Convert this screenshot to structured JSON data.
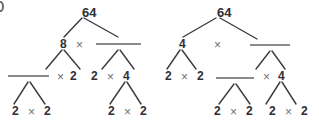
{
  "page": {
    "background_color": "#ffffff",
    "ink_color": "#2e2e33",
    "times_color": "#6e6e76",
    "blank_line_color": "#8a8a90",
    "branch_color": "#3a3a42",
    "corner_mark": ")"
  },
  "diagram": {
    "type": "factor-trees",
    "trees": [
      {
        "id": "factor-tree-left",
        "root": "64",
        "nodes": [
          {
            "id": "l-root",
            "label": "64",
            "x": 82,
            "y": 12,
            "kind": "number"
          },
          {
            "id": "l-a",
            "label": "8",
            "x": 60,
            "y": 44,
            "kind": "number"
          },
          {
            "id": "l-op1",
            "label": "×",
            "x": 76,
            "y": 45,
            "kind": "operator"
          },
          {
            "id": "l-b",
            "label": "",
            "x": 117,
            "y": 44,
            "kind": "blank"
          },
          {
            "id": "l-c",
            "label": "",
            "x": 28,
            "y": 76,
            "kind": "blank"
          },
          {
            "id": "l-op2",
            "label": "×",
            "x": 57,
            "y": 77,
            "kind": "operator"
          },
          {
            "id": "l-d",
            "label": "2",
            "x": 70,
            "y": 76,
            "kind": "number"
          },
          {
            "id": "l-e",
            "label": "2",
            "x": 91,
            "y": 76,
            "kind": "number"
          },
          {
            "id": "l-op3",
            "label": "×",
            "x": 107,
            "y": 77,
            "kind": "operator"
          },
          {
            "id": "l-f",
            "label": "4",
            "x": 123,
            "y": 76,
            "kind": "number"
          },
          {
            "id": "l-g",
            "label": "2",
            "x": 12,
            "y": 111,
            "kind": "number"
          },
          {
            "id": "l-op4",
            "label": "×",
            "x": 28,
            "y": 112,
            "kind": "operator"
          },
          {
            "id": "l-h",
            "label": "2",
            "x": 44,
            "y": 111,
            "kind": "number"
          },
          {
            "id": "l-i",
            "label": "2",
            "x": 108,
            "y": 111,
            "kind": "number"
          },
          {
            "id": "l-op5",
            "label": "×",
            "x": 124,
            "y": 112,
            "kind": "operator"
          },
          {
            "id": "l-j",
            "label": "2",
            "x": 140,
            "y": 111,
            "kind": "number"
          }
        ],
        "blanks": [
          {
            "id": "l-blank-1",
            "x1": 96,
            "x2": 141,
            "y": 44
          },
          {
            "id": "l-blank-2",
            "x1": 8,
            "x2": 49,
            "y": 76
          }
        ],
        "branches": [
          {
            "from": [
              82,
              18
            ],
            "to": [
              64,
              37
            ]
          },
          {
            "from": [
              84,
              18
            ],
            "to": [
              118,
              37
            ]
          },
          {
            "from": [
              62,
              50
            ],
            "to": [
              46,
              69
            ]
          },
          {
            "from": [
              64,
              50
            ],
            "to": [
              80,
              69
            ]
          },
          {
            "from": [
              118,
              50
            ],
            "to": [
              102,
              69
            ]
          },
          {
            "from": [
              120,
              50
            ],
            "to": [
              134,
              69
            ]
          },
          {
            "from": [
              28,
              82
            ],
            "to": [
              14,
              104
            ]
          },
          {
            "from": [
              30,
              82
            ],
            "to": [
              45,
              104
            ]
          },
          {
            "from": [
              125,
              82
            ],
            "to": [
              110,
              104
            ]
          },
          {
            "from": [
              127,
              82
            ],
            "to": [
              141,
              104
            ]
          }
        ]
      },
      {
        "id": "factor-tree-right",
        "root": "64",
        "nodes": [
          {
            "id": "r-root",
            "label": "64",
            "x": 217,
            "y": 12,
            "kind": "number"
          },
          {
            "id": "r-a",
            "label": "4",
            "x": 179,
            "y": 44,
            "kind": "number"
          },
          {
            "id": "r-op1",
            "label": "×",
            "x": 214,
            "y": 45,
            "kind": "operator"
          },
          {
            "id": "r-b",
            "label": "",
            "x": 269,
            "y": 44,
            "kind": "blank"
          },
          {
            "id": "r-c",
            "label": "2",
            "x": 165,
            "y": 76,
            "kind": "number"
          },
          {
            "id": "r-op2",
            "label": "×",
            "x": 181,
            "y": 77,
            "kind": "operator"
          },
          {
            "id": "r-d",
            "label": "2",
            "x": 197,
            "y": 76,
            "kind": "number"
          },
          {
            "id": "r-e",
            "label": "",
            "x": 235,
            "y": 78,
            "kind": "blank"
          },
          {
            "id": "r-op3",
            "label": "×",
            "x": 263,
            "y": 77,
            "kind": "operator"
          },
          {
            "id": "r-f",
            "label": "4",
            "x": 278,
            "y": 76,
            "kind": "number"
          },
          {
            "id": "r-g",
            "label": "2",
            "x": 214,
            "y": 111,
            "kind": "number"
          },
          {
            "id": "r-op4",
            "label": "×",
            "x": 230,
            "y": 112,
            "kind": "operator"
          },
          {
            "id": "r-h",
            "label": "2",
            "x": 246,
            "y": 111,
            "kind": "number"
          },
          {
            "id": "r-i",
            "label": "2",
            "x": 269,
            "y": 111,
            "kind": "number"
          },
          {
            "id": "r-op5",
            "label": "×",
            "x": 285,
            "y": 112,
            "kind": "operator"
          },
          {
            "id": "r-j",
            "label": "2",
            "x": 301,
            "y": 111,
            "kind": "number"
          }
        ],
        "blanks": [
          {
            "id": "r-blank-1",
            "x1": 250,
            "x2": 290,
            "y": 45
          },
          {
            "id": "r-blank-2",
            "x1": 216,
            "x2": 254,
            "y": 78
          }
        ],
        "branches": [
          {
            "from": [
              216,
              18
            ],
            "to": [
              183,
              37
            ]
          },
          {
            "from": [
              220,
              18
            ],
            "to": [
              257,
              39
            ]
          },
          {
            "from": [
              180,
              50
            ],
            "to": [
              167,
              69
            ]
          },
          {
            "from": [
              182,
              50
            ],
            "to": [
              196,
              69
            ]
          },
          {
            "from": [
              270,
              51
            ],
            "to": [
              256,
              69
            ]
          },
          {
            "from": [
              272,
              51
            ],
            "to": [
              285,
              69
            ]
          },
          {
            "from": [
              234,
              84
            ],
            "to": [
              219,
              104
            ]
          },
          {
            "from": [
              236,
              84
            ],
            "to": [
              250,
              104
            ]
          },
          {
            "from": [
              280,
              82
            ],
            "to": [
              266,
              104
            ]
          },
          {
            "from": [
              282,
              82
            ],
            "to": [
              296,
              104
            ]
          }
        ]
      }
    ]
  }
}
